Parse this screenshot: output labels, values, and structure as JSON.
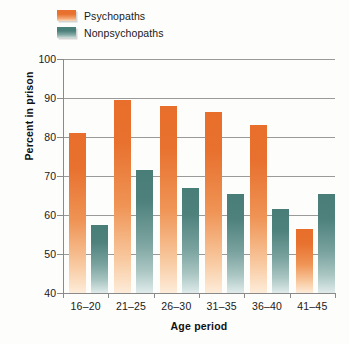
{
  "chart_data": {
    "type": "bar",
    "title": "",
    "xlabel": "Age period",
    "ylabel": "Percent in prison",
    "categories": [
      "16–20",
      "21–25",
      "26–30",
      "31–35",
      "36–40",
      "41–45"
    ],
    "ylim": [
      40,
      100
    ],
    "yticks": [
      40,
      50,
      60,
      70,
      80,
      90,
      100
    ],
    "ytick_labels": [
      "40",
      "50",
      "60",
      "70",
      "80",
      "90",
      "100"
    ],
    "grid": true,
    "legend_position": "top-left",
    "series": [
      {
        "name": "Psychopaths",
        "color": "#e8712f",
        "values": [
          81,
          89.5,
          88,
          86.5,
          83,
          56.5
        ]
      },
      {
        "name": "Nonpsychopaths",
        "color": "#4b7f7a",
        "values": [
          57.5,
          71.5,
          67,
          65.5,
          61.5,
          65.5
        ]
      }
    ]
  },
  "legend": {
    "items": [
      {
        "label": "Psychopaths",
        "swatch": "psychopaths-swatch"
      },
      {
        "label": "Nonpsychopaths",
        "swatch": "nonpsychopaths-swatch"
      }
    ]
  },
  "axes": {
    "y_title": "Percent in prison",
    "x_title": "Age period"
  }
}
